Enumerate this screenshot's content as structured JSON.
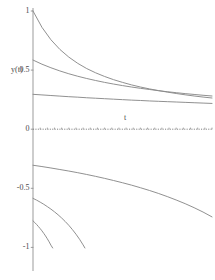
{
  "chart_data": {
    "type": "line",
    "title": "",
    "subtitle": "",
    "xlabel": "t",
    "ylabel": "y(t)",
    "xlim": [
      0,
      5
    ],
    "ylim": [
      -1.05,
      1.02
    ],
    "grid": false,
    "legend": null,
    "x_ticks": [],
    "x_tick_labels": [],
    "y_ticks": [
      1,
      0.5,
      0,
      -0.5,
      -1
    ],
    "y_tick_labels": [
      "1",
      "0.5",
      "0",
      "-0.5",
      "-1"
    ],
    "axis_color": "#808080",
    "curve_color": "#8a8a8a",
    "zero_line_style": "dotted",
    "series": [
      {
        "name": "c1",
        "y0": 1.0,
        "values": [
          [
            0.0,
            1.0
          ],
          [
            0.25,
            0.862
          ],
          [
            0.5,
            0.757
          ],
          [
            0.75,
            0.675
          ],
          [
            1.0,
            0.61
          ],
          [
            1.25,
            0.557
          ],
          [
            1.5,
            0.513
          ],
          [
            1.75,
            0.477
          ],
          [
            2.0,
            0.446
          ],
          [
            2.25,
            0.419
          ],
          [
            2.5,
            0.396
          ],
          [
            2.75,
            0.375
          ],
          [
            3.0,
            0.357
          ],
          [
            3.25,
            0.341
          ],
          [
            3.5,
            0.327
          ],
          [
            3.75,
            0.314
          ],
          [
            4.0,
            0.302
          ],
          [
            4.25,
            0.291
          ],
          [
            4.5,
            0.281
          ],
          [
            4.75,
            0.272
          ],
          [
            5.0,
            0.264
          ]
        ]
      },
      {
        "name": "c2",
        "y0": 0.585,
        "values": [
          [
            0.0,
            0.585
          ],
          [
            0.25,
            0.55
          ],
          [
            0.5,
            0.52
          ],
          [
            0.75,
            0.493
          ],
          [
            1.0,
            0.469
          ],
          [
            1.25,
            0.448
          ],
          [
            1.5,
            0.429
          ],
          [
            1.75,
            0.412
          ],
          [
            2.0,
            0.396
          ],
          [
            2.25,
            0.382
          ],
          [
            2.5,
            0.369
          ],
          [
            2.75,
            0.357
          ],
          [
            3.0,
            0.346
          ],
          [
            3.25,
            0.336
          ],
          [
            3.5,
            0.326
          ],
          [
            3.75,
            0.317
          ],
          [
            4.0,
            0.309
          ],
          [
            4.25,
            0.301
          ],
          [
            4.5,
            0.294
          ],
          [
            4.75,
            0.287
          ],
          [
            5.0,
            0.281
          ]
        ]
      },
      {
        "name": "c3",
        "y0": 0.295,
        "values": [
          [
            0.0,
            0.295
          ],
          [
            0.25,
            0.29
          ],
          [
            0.5,
            0.285
          ],
          [
            0.75,
            0.28
          ],
          [
            1.0,
            0.275
          ],
          [
            1.25,
            0.271
          ],
          [
            1.5,
            0.266
          ],
          [
            1.75,
            0.262
          ],
          [
            2.0,
            0.258
          ],
          [
            2.25,
            0.254
          ],
          [
            2.5,
            0.25
          ],
          [
            2.75,
            0.246
          ],
          [
            3.0,
            0.243
          ],
          [
            3.25,
            0.239
          ],
          [
            3.5,
            0.236
          ],
          [
            3.75,
            0.233
          ],
          [
            4.0,
            0.23
          ],
          [
            4.25,
            0.227
          ],
          [
            4.5,
            0.224
          ],
          [
            4.75,
            0.221
          ],
          [
            5.0,
            0.218
          ]
        ]
      },
      {
        "name": "c4",
        "y0": -0.305,
        "values": [
          [
            0.0,
            -0.305
          ],
          [
            0.25,
            -0.316
          ],
          [
            0.5,
            -0.328
          ],
          [
            0.75,
            -0.341
          ],
          [
            1.0,
            -0.354
          ],
          [
            1.25,
            -0.368
          ],
          [
            1.5,
            -0.383
          ],
          [
            1.75,
            -0.399
          ],
          [
            2.0,
            -0.416
          ],
          [
            2.25,
            -0.434
          ],
          [
            2.5,
            -0.453
          ],
          [
            2.75,
            -0.473
          ],
          [
            3.0,
            -0.495
          ],
          [
            3.25,
            -0.518
          ],
          [
            3.5,
            -0.543
          ],
          [
            3.75,
            -0.57
          ],
          [
            4.0,
            -0.599
          ],
          [
            4.25,
            -0.63
          ],
          [
            4.5,
            -0.664
          ],
          [
            4.75,
            -0.701
          ],
          [
            5.0,
            -0.742
          ]
        ]
      },
      {
        "name": "c5",
        "y0": -0.585,
        "values": [
          [
            0.0,
            -0.585
          ],
          [
            0.1,
            -0.6
          ],
          [
            0.2,
            -0.617
          ],
          [
            0.3,
            -0.635
          ],
          [
            0.4,
            -0.655
          ],
          [
            0.5,
            -0.676
          ],
          [
            0.6,
            -0.699
          ],
          [
            0.7,
            -0.724
          ],
          [
            0.8,
            -0.751
          ],
          [
            0.9,
            -0.781
          ],
          [
            1.0,
            -0.813
          ],
          [
            1.1,
            -0.849
          ],
          [
            1.2,
            -0.888
          ],
          [
            1.3,
            -0.931
          ],
          [
            1.4,
            -0.979
          ],
          [
            1.45,
            -1.005
          ]
        ]
      },
      {
        "name": "c6",
        "y0": -0.775,
        "values": [
          [
            0.0,
            -0.775
          ],
          [
            0.05,
            -0.79
          ],
          [
            0.1,
            -0.806
          ],
          [
            0.15,
            -0.823
          ],
          [
            0.2,
            -0.841
          ],
          [
            0.25,
            -0.86
          ],
          [
            0.3,
            -0.881
          ],
          [
            0.35,
            -0.903
          ],
          [
            0.4,
            -0.927
          ],
          [
            0.45,
            -0.953
          ],
          [
            0.5,
            -0.981
          ],
          [
            0.55,
            -1.005
          ]
        ]
      }
    ]
  },
  "axes": {
    "y_label": "y(t)",
    "x_label": "t",
    "y_tick_labels": [
      {
        "text": "1",
        "value": 1
      },
      {
        "text": "0.5",
        "value": 0.5
      },
      {
        "text": "0",
        "value": 0
      },
      {
        "text": "-0.5",
        "value": -0.5
      },
      {
        "text": "-1",
        "value": -1
      }
    ]
  }
}
